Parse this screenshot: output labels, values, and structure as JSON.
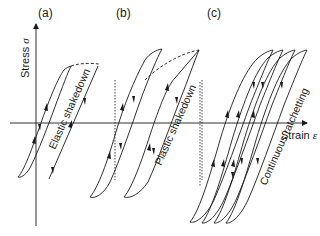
{
  "figure": {
    "panels": [
      {
        "id": "a",
        "label": "(a)",
        "annotation": "Elastic shakedown"
      },
      {
        "id": "b",
        "label": "(b)",
        "annotation": "Plastic shakedown"
      },
      {
        "id": "c",
        "label": "(c)",
        "annotation": "Continuous ratchetting"
      }
    ],
    "axes": {
      "y_label": "Stress",
      "y_symbol": "σ",
      "x_label": "Strain",
      "x_symbol": "ε"
    }
  }
}
